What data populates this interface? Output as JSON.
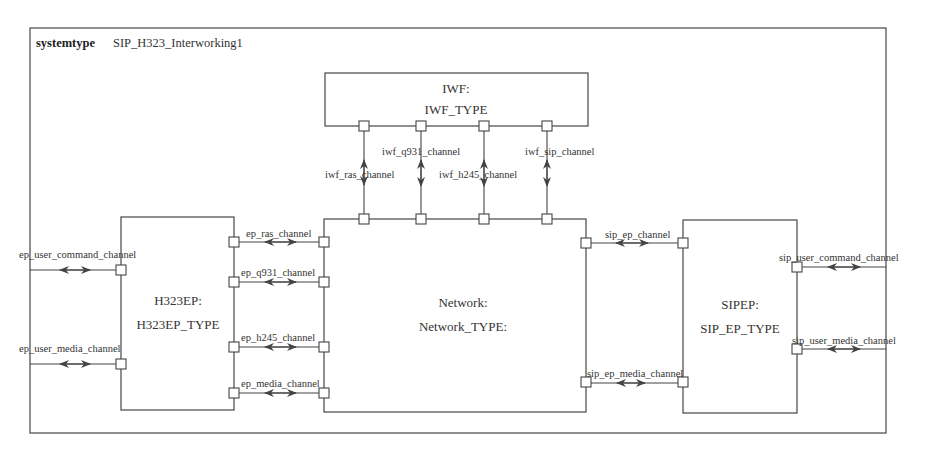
{
  "system": {
    "keyword": "systemtype",
    "name": "SIP_H323_Interworking1"
  },
  "blocks": {
    "iwf": {
      "instance": "IWF:",
      "type": "IWF_TYPE"
    },
    "h323ep": {
      "instance": "H323EP:",
      "type": "H323EP_TYPE"
    },
    "network": {
      "instance": "Network:",
      "type": "Network_TYPE:"
    },
    "sipep": {
      "instance": "SIPEP:",
      "type": "SIP_EP_TYPE"
    }
  },
  "channels": {
    "ep_user_command": "ep_user_command_channel",
    "ep_user_media": "ep_user_media_channel",
    "ep_ras": "ep_ras_channel",
    "ep_q931": "ep_q931_channel",
    "ep_h245": "ep_h245_channel",
    "ep_media": "ep_media_channel",
    "iwf_ras": "iwf_ras_channel",
    "iwf_q931": "iwf_q931_channel",
    "iwf_h245": "iwf_h245_channel",
    "iwf_sip": "iwf_sip_channel",
    "sip_ep": "sip_ep_channel",
    "sip_ep_media": "sip_ep_media_channel",
    "sip_user_command": "sip_user_command_channel",
    "sip_user_media": "sip_user_media_channel"
  },
  "colors": {
    "stroke": "#444444",
    "background": "#ffffff"
  }
}
